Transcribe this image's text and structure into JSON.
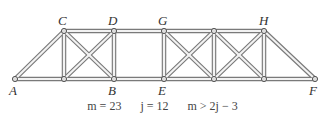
{
  "joints": {
    "A": {
      "label": "A",
      "x": 15,
      "y": 79,
      "lx": 9,
      "ly": 82
    },
    "C": {
      "label": "C",
      "x": 64,
      "y": 31,
      "lx": 58,
      "ly": 14
    },
    "D": {
      "label": "D",
      "x": 114,
      "y": 31,
      "lx": 108,
      "ly": 14
    },
    "B": {
      "label": "B",
      "x": 114,
      "y": 79,
      "lx": 108,
      "ly": 82
    },
    "G": {
      "label": "G",
      "x": 164,
      "y": 31,
      "lx": 158,
      "ly": 14
    },
    "E": {
      "label": "E",
      "x": 164,
      "y": 79,
      "lx": 158,
      "ly": 82
    },
    "H": {
      "label": "H",
      "x": 264,
      "y": 31,
      "lx": 258,
      "ly": 14
    },
    "F": {
      "label": "F",
      "x": 315,
      "y": 79,
      "lx": 310,
      "ly": 82
    }
  },
  "equation": {
    "m_label": "m = 23",
    "j_label": "j = 12",
    "cond_label": "m > 2j − 3"
  },
  "colors": {
    "member": "#777777",
    "fill": "#f4f4f4"
  }
}
